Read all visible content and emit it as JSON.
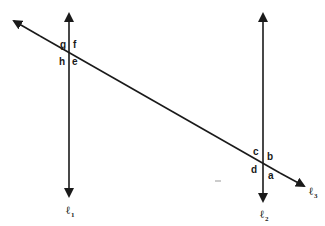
{
  "diagram": {
    "lines": [
      {
        "id": "l1",
        "label": "ℓ",
        "subscript": "1",
        "type": "vertical-line",
        "x": 69,
        "y1": 12,
        "y2": 197
      },
      {
        "id": "l2",
        "label": "ℓ",
        "subscript": "2",
        "type": "vertical-line",
        "x": 263,
        "y1": 12,
        "y2": 202
      },
      {
        "id": "l3",
        "label": "ℓ",
        "subscript": "3",
        "type": "transversal",
        "x1": 12,
        "y1": 20,
        "x2": 305,
        "y2": 187
      }
    ],
    "angle_labels_l1": {
      "g": "g",
      "f": "f",
      "h": "h",
      "e": "e"
    },
    "angle_labels_l2": {
      "c": "c",
      "b": "b",
      "d": "d",
      "a": "a"
    },
    "colors": {
      "stroke": "#1a1a1a",
      "background": "#ffffff",
      "mark": "#999999"
    }
  }
}
